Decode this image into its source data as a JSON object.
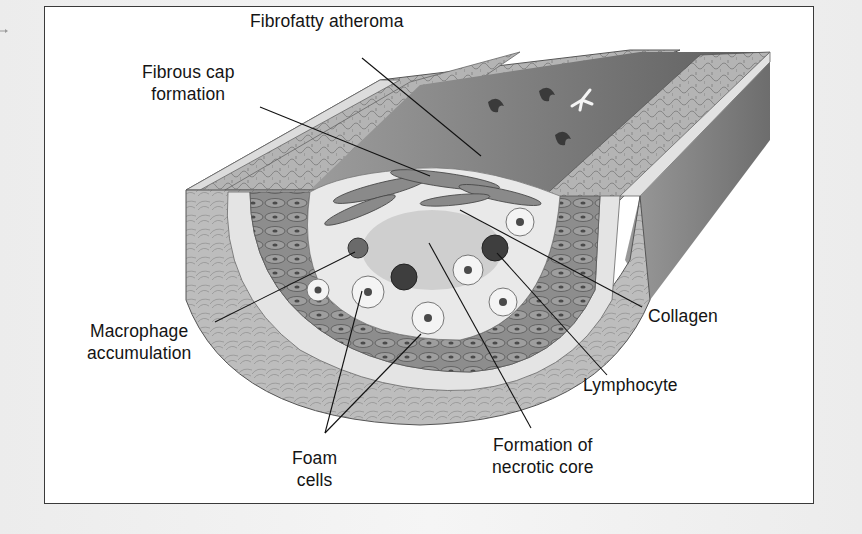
{
  "figure": {
    "colors": {
      "frame_border": "#3a3a3a",
      "background": "#ffffff",
      "adventitia": "#b9b9b9",
      "media_light_band": "#e4e4e4",
      "smooth_muscle": "#8f8f8f",
      "lumen": "#7d7d7d",
      "lipid_core": "#d6d6d6",
      "leader_line": "#111111",
      "label_text": "#141414"
    },
    "labels": [
      {
        "id": "fibrofatty-atheroma",
        "lines": [
          "Fibrofatty atheroma"
        ],
        "x": 250,
        "y": 10,
        "anchor": "left"
      },
      {
        "id": "fibrous-cap-formation",
        "lines": [
          "Fibrous cap",
          "formation"
        ],
        "x": 142,
        "y": 61,
        "anchor": "center"
      },
      {
        "id": "macrophage-accumulation",
        "lines": [
          "Macrophage",
          "accumulation"
        ],
        "x": 87,
        "y": 320,
        "anchor": "center"
      },
      {
        "id": "foam-cells",
        "lines": [
          "Foam",
          "cells"
        ],
        "x": 292,
        "y": 447,
        "anchor": "center"
      },
      {
        "id": "formation-of-necrotic-core",
        "lines": [
          "Formation of",
          "necrotic core"
        ],
        "x": 492,
        "y": 434,
        "anchor": "center"
      },
      {
        "id": "lymphocyte",
        "lines": [
          "Lymphocyte"
        ],
        "x": 583,
        "y": 374,
        "anchor": "left"
      },
      {
        "id": "collagen",
        "lines": [
          "Collagen"
        ],
        "x": 648,
        "y": 305,
        "anchor": "left"
      }
    ],
    "leader_lines": [
      {
        "label": "fibrofatty-atheroma",
        "from": [
          362,
          58
        ],
        "to": [
          481,
          156
        ]
      },
      {
        "label": "fibrous-cap-formation",
        "from": [
          260,
          107
        ],
        "to": [
          430,
          176
        ]
      },
      {
        "label": "macrophage-accumulation",
        "from": [
          215,
          322
        ],
        "to": [
          355,
          252
        ]
      },
      {
        "label": "foam-cells-1",
        "from": [
          325,
          433
        ],
        "to": [
          362,
          291
        ]
      },
      {
        "label": "foam-cells-2",
        "from": [
          325,
          433
        ],
        "to": [
          421,
          334
        ]
      },
      {
        "label": "formation-of-necrotic-core",
        "from": [
          531,
          428
        ],
        "to": [
          429,
          243
        ]
      },
      {
        "label": "lymphocyte",
        "from": [
          607,
          375
        ],
        "to": [
          497,
          253
        ]
      },
      {
        "label": "collagen",
        "from": [
          642,
          307
        ],
        "to": [
          460,
          210
        ]
      }
    ]
  }
}
